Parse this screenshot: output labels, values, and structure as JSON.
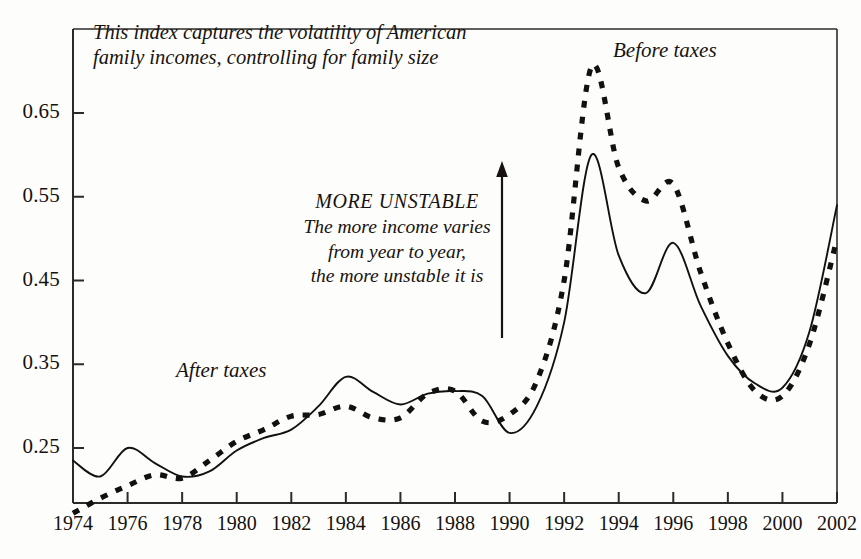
{
  "chart_data": {
    "type": "line",
    "title": "",
    "subtitle": "",
    "xlabel": "",
    "ylabel": "",
    "grid": false,
    "legend_position": "inline-annotation",
    "xlim": [
      1974,
      2002
    ],
    "ylim": [
      0.17,
      0.72
    ],
    "x_tick_labels": [
      "1974",
      "1976",
      "1978",
      "1980",
      "1982",
      "1984",
      "1986",
      "1988",
      "1990",
      "1992",
      "1994",
      "1996",
      "1998",
      "2000",
      "2002"
    ],
    "x_ticks": [
      1974,
      1976,
      1978,
      1980,
      1982,
      1984,
      1986,
      1988,
      1990,
      1992,
      1994,
      1996,
      1998,
      2000,
      2002
    ],
    "y_tick_labels": [
      "0.65",
      "0.55",
      "0.45",
      "0.35",
      "0.25"
    ],
    "y_ticks": [
      0.65,
      0.55,
      0.45,
      0.35,
      0.25
    ],
    "x": [
      1974,
      1975,
      1976,
      1977,
      1978,
      1979,
      1980,
      1981,
      1982,
      1983,
      1984,
      1985,
      1986,
      1987,
      1988,
      1989,
      1990,
      1991,
      1992,
      1993,
      1994,
      1995,
      1996,
      1997,
      1998,
      1999,
      2000,
      2001,
      2002
    ],
    "series": [
      {
        "name": "After taxes",
        "style": "solid",
        "color": "#111111",
        "values": [
          0.235,
          0.216,
          0.25,
          0.232,
          0.216,
          0.222,
          0.247,
          0.262,
          0.272,
          0.3,
          0.335,
          0.317,
          0.302,
          0.315,
          0.318,
          0.312,
          0.268,
          0.3,
          0.4,
          0.6,
          0.48,
          0.435,
          0.495,
          0.42,
          0.36,
          0.327,
          0.322,
          0.39,
          0.54
        ]
      },
      {
        "name": "Before taxes",
        "style": "dashed",
        "color": "#111111",
        "values": [
          0.172,
          0.19,
          0.205,
          0.218,
          0.214,
          0.235,
          0.258,
          0.272,
          0.288,
          0.29,
          0.3,
          0.286,
          0.286,
          0.315,
          0.318,
          0.282,
          0.29,
          0.33,
          0.45,
          0.705,
          0.585,
          0.545,
          0.565,
          0.46,
          0.375,
          0.318,
          0.312,
          0.375,
          0.5
        ]
      }
    ]
  },
  "annotations": {
    "caption": {
      "line1": "This index captures the volatility of American",
      "line2": "family incomes, controlling for family size"
    },
    "more_unstable": {
      "heading": "MORE UNSTABLE",
      "line1": "The more income varies",
      "line2": "from year to year,",
      "line3": "the more unstable it is"
    },
    "arrow": {
      "name": "upward-arrow",
      "direction": "up"
    },
    "series_labels": {
      "before": "Before taxes",
      "after": "After taxes"
    }
  },
  "colors": {
    "ink": "#111111",
    "background": "#fdfdfb",
    "axis": "#2b2b2b"
  }
}
